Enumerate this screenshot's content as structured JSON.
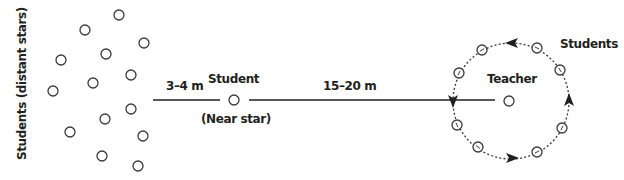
{
  "diagram": {
    "colors": {
      "ink": "#231f20",
      "circle_stroke": "#3a3a3a",
      "background": "#ffffff"
    },
    "labels": {
      "distant_stars": "Students (distant stars)",
      "near_distance": "3–4 m",
      "near_student": "Student",
      "near_star": "(Near star)",
      "far_distance": "15–20 m",
      "teacher": "Teacher",
      "orbit_students": "Students"
    },
    "distant_stars": [
      {
        "x": 119,
        "y": 15
      },
      {
        "x": 85,
        "y": 30
      },
      {
        "x": 144,
        "y": 43
      },
      {
        "x": 106,
        "y": 54
      },
      {
        "x": 61,
        "y": 60
      },
      {
        "x": 131,
        "y": 75
      },
      {
        "x": 93,
        "y": 83
      },
      {
        "x": 53,
        "y": 91
      },
      {
        "x": 131,
        "y": 109
      },
      {
        "x": 105,
        "y": 119
      },
      {
        "x": 70,
        "y": 132
      },
      {
        "x": 143,
        "y": 136
      },
      {
        "x": 102,
        "y": 156
      },
      {
        "x": 138,
        "y": 166
      }
    ],
    "near_star": {
      "x": 234,
      "y": 100
    },
    "teacher": {
      "x": 509,
      "y": 101
    },
    "orbit": {
      "cx": 511,
      "cy": 101,
      "r": 58
    },
    "orbit_students": [
      {
        "x": 482,
        "y": 50
      },
      {
        "x": 537,
        "y": 48
      },
      {
        "x": 560,
        "y": 70
      },
      {
        "x": 459,
        "y": 73
      },
      {
        "x": 457,
        "y": 125
      },
      {
        "x": 478,
        "y": 147
      },
      {
        "x": 537,
        "y": 152
      },
      {
        "x": 562,
        "y": 128
      }
    ],
    "orbit_direction": "counterclockwise"
  }
}
